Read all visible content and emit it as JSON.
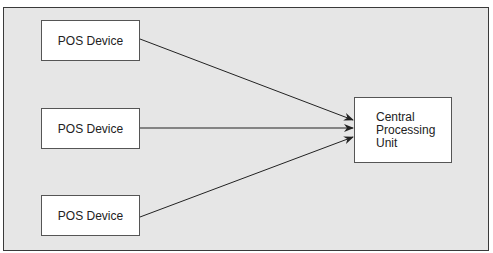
{
  "diagram": {
    "type": "flow",
    "nodes": [
      {
        "id": "pos1",
        "label": "POS Device"
      },
      {
        "id": "pos2",
        "label": "POS Device"
      },
      {
        "id": "pos3",
        "label": "POS Device"
      },
      {
        "id": "cpu",
        "label": "Central\nProcessing\nUnit"
      }
    ],
    "edges": [
      {
        "from": "pos1",
        "to": "cpu"
      },
      {
        "from": "pos2",
        "to": "cpu"
      },
      {
        "from": "pos3",
        "to": "cpu"
      }
    ]
  },
  "colors": {
    "frame_background": "#e6e6e6",
    "frame_border": "#3a3a3a",
    "node_background": "#ffffff",
    "node_border": "#555555",
    "arrow": "#222222"
  }
}
